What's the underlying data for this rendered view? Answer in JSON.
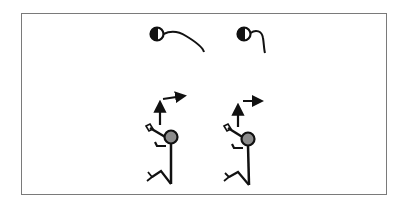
{
  "figure": {
    "caption": "",
    "colors": {
      "stroke": "#111111",
      "head_fill": "#8c8c8c",
      "frame": "#7a7a7a",
      "background": "#ffffff"
    },
    "top_symbols": [
      {
        "name": "head-with-long-curve",
        "description": "half-filled circle with a long trailing curve"
      },
      {
        "name": "head-with-short-hook",
        "description": "half-filled circle with a short hooked curve"
      }
    ],
    "figures": [
      {
        "name": "jumping-figure-1",
        "arrow": "up-then-right arrow (angled)"
      },
      {
        "name": "jumping-figure-2",
        "arrow": "up arrow with separate right arrow"
      }
    ]
  }
}
